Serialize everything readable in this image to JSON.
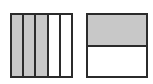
{
  "figures": [
    {
      "id": "left",
      "orientation": "vertical-strips",
      "parts_total": 5,
      "parts_shaded": 3,
      "fraction": "3/5",
      "shaded_color": "#c8c8c8",
      "unshaded_color": "#ffffff",
      "border_color": "#2b2b2b"
    },
    {
      "id": "right",
      "orientation": "horizontal-strips",
      "parts_total": 2,
      "parts_shaded": 1,
      "fraction": "1/2",
      "shaded_color": "#c8c8c8",
      "unshaded_color": "#ffffff",
      "border_color": "#2b2b2b"
    }
  ]
}
